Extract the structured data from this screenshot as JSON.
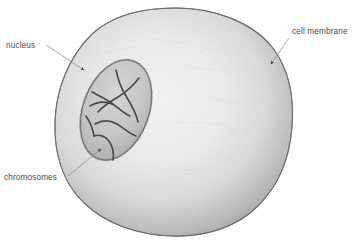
{
  "figure": {
    "background_color": "#ffffff",
    "width": 354,
    "height": 244
  },
  "labels": [
    {
      "id": "nucleus",
      "text": "nucleus",
      "text_x": 6,
      "text_y": 48,
      "anchor": "start",
      "leader": {
        "x1": 46,
        "y1": 45,
        "x2": 86,
        "y2": 71
      },
      "arrow": {
        "x": 88,
        "y": 73,
        "angle": 33
      }
    },
    {
      "id": "chromosomes",
      "text": "chromosomes",
      "text_x": 4,
      "text_y": 180,
      "anchor": "start",
      "leader": {
        "x1": 68,
        "y1": 176,
        "x2": 103,
        "y2": 147
      },
      "arrow": {
        "x": 105,
        "y": 145,
        "angle": -40
      }
    },
    {
      "id": "cell-membrane",
      "text": "cell membrane",
      "text_x": 292,
      "text_y": 34,
      "anchor": "start",
      "leader": {
        "x1": 289,
        "y1": 38,
        "x2": 270,
        "y2": 65
      },
      "arrow": {
        "x": 268,
        "y": 68,
        "angle": 125
      }
    }
  ],
  "cell": {
    "name": "cell-body",
    "outline_color": "#7d7d7d",
    "fill_light": "#f4f4f4",
    "fill_mid": "#d8d8d8",
    "fill_dark": "#8d8d8d",
    "bounds": {
      "left": 55,
      "top": 8,
      "right": 293,
      "bottom": 236
    }
  },
  "nucleus": {
    "name": "nucleus-body",
    "center_x": 116,
    "center_y": 110,
    "radius_x": 33,
    "radius_y": 52,
    "rotation": 20,
    "outline_color": "#6f6f6f",
    "fill_color": "#c4c4c4"
  },
  "chromosomes": {
    "name": "chromosome-threads",
    "stroke_color": "#4d4d4d",
    "count": 6
  },
  "colors": {
    "label_text": "#4a4a4a",
    "leader_line": "#8a8a8a",
    "background": "#ffffff"
  }
}
